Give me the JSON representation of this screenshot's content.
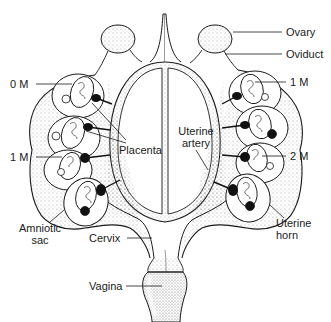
{
  "diagram": {
    "colors": {
      "line": "#1a1a1a",
      "stipple": "#8a8a8a",
      "placenta": "#111111",
      "background": "#ffffff"
    },
    "labels": {
      "ovary": "Ovary",
      "oviduct": "Oviduct",
      "left_0m": "0 M",
      "left_1m": "1 M",
      "right_1m": "1 M",
      "right_2m": "2 M",
      "placenta": "Placenta",
      "uterine_artery_line1": "Uterine",
      "uterine_artery_line2": "artery",
      "amniotic_sac_line1": "Amniotic",
      "amniotic_sac_line2": "sac",
      "uterine_horn_line1": "Uterine",
      "uterine_horn_line2": "horn",
      "cervix": "Cervix",
      "vagina": "Vagina"
    },
    "fetuses": {
      "left_horn": [
        {
          "position": 1,
          "sex": "female",
          "label": "0 M"
        },
        {
          "position": 2,
          "sex": "female",
          "label": ""
        },
        {
          "position": 3,
          "sex": "female",
          "label": "1 M"
        },
        {
          "position": 4,
          "sex": "male",
          "label": ""
        }
      ],
      "right_horn": [
        {
          "position": 1,
          "sex": "female",
          "label": "1 M"
        },
        {
          "position": 2,
          "sex": "male",
          "label": ""
        },
        {
          "position": 3,
          "sex": "female",
          "label": "2 M"
        },
        {
          "position": 4,
          "sex": "male",
          "label": ""
        }
      ]
    }
  }
}
